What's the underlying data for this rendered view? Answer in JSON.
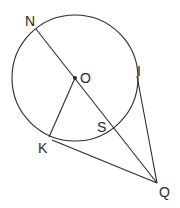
{
  "diagram": {
    "type": "geometry",
    "labels": {
      "N": "N",
      "O": "O",
      "I": "I",
      "S": "S",
      "K": "K",
      "Q": "Q"
    },
    "points": {
      "O": [
        75,
        78
      ],
      "N": [
        36,
        29
      ],
      "S": [
        114,
        128
      ],
      "K": [
        49,
        137
      ],
      "I": [
        137,
        76
      ],
      "Q": [
        157,
        183
      ]
    },
    "circle": {
      "center": "O",
      "radius": 63
    },
    "segments": [
      "N-Q",
      "O-K",
      "K-Q",
      "I-Q"
    ],
    "colors": {
      "stroke": "#2a2a2a",
      "background": "#ffffff"
    }
  }
}
